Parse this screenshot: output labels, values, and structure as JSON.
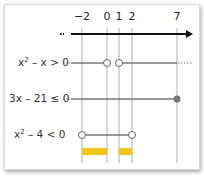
{
  "diagram": {
    "type": "sign-chart / number line",
    "axis": {
      "ticks": [
        {
          "label": "−2",
          "value": -2,
          "x": 82
        },
        {
          "label": "0",
          "value": 0,
          "x": 107
        },
        {
          "label": "1",
          "value": 1,
          "x": 119
        },
        {
          "label": "2",
          "value": 2,
          "x": 132
        },
        {
          "label": "7",
          "value": 7,
          "x": 177
        }
      ]
    },
    "rows": [
      {
        "label_base": "x",
        "label_sup": "2",
        "label_rest": " – x > 0",
        "solution": "x < 0 or x > 1",
        "endpoints": [
          {
            "value": 0,
            "type": "open"
          },
          {
            "value": 1,
            "type": "open"
          }
        ]
      },
      {
        "label_base": "3x – 21 ≤ 0",
        "label_sup": "",
        "label_rest": "",
        "solution": "x ≤ 7",
        "endpoints": [
          {
            "value": 7,
            "type": "closed"
          }
        ]
      },
      {
        "label_base": "x",
        "label_sup": "2",
        "label_rest": " – 4 < 0",
        "solution": "−2 < x < 2",
        "endpoints": [
          {
            "value": -2,
            "type": "open"
          },
          {
            "value": 2,
            "type": "open"
          }
        ]
      }
    ],
    "intersection": [
      {
        "from": -2,
        "to": 0
      },
      {
        "from": 1,
        "to": 2
      }
    ],
    "colors": {
      "line": "#777777",
      "axis": "#111111",
      "highlight": "#f0c419",
      "guide": "#999999"
    }
  }
}
